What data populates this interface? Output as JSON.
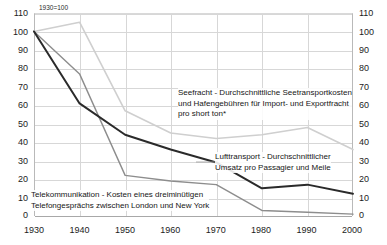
{
  "chart_data": {
    "type": "line",
    "title": "",
    "subtitle": "",
    "index_note": "1930=100",
    "xlabel": "",
    "ylabel": "",
    "x": [
      1930,
      1940,
      1950,
      1960,
      1970,
      1980,
      1990,
      2000
    ],
    "xtick_labels": [
      "1930",
      "1940",
      "1950",
      "1960",
      "1970",
      "1980",
      "1990",
      "2000"
    ],
    "xlim": [
      1930,
      2000
    ],
    "ylim": [
      0,
      110
    ],
    "ytick_labels": [
      "0",
      "10",
      "20",
      "30",
      "40",
      "50",
      "60",
      "70",
      "80",
      "90",
      "100",
      "110"
    ],
    "ytick_values": [
      0,
      10,
      20,
      30,
      40,
      50,
      60,
      70,
      80,
      90,
      100,
      110
    ],
    "grid": true,
    "legend": "annotations-inline",
    "dual_y_axis": true,
    "series": [
      {
        "name": "Seefracht",
        "color": "#cfcfcf",
        "width": 1.6,
        "values": [
          100,
          105,
          57,
          45,
          42,
          44,
          48,
          36
        ]
      },
      {
        "name": "Telekommunikation",
        "color": "#8d8d8d",
        "width": 1.4,
        "values": [
          100,
          77,
          22,
          19,
          17,
          3,
          2,
          1
        ]
      },
      {
        "name": "Lufttransport",
        "color": "#2a2a2a",
        "width": 2.0,
        "values": [
          100,
          61,
          44,
          36,
          29,
          15,
          17,
          12
        ]
      }
    ],
    "annotations": {
      "sea": {
        "lines": [
          "Seefracht - Durchschnittliche Seetransportkosten",
          "und Hafengebühren für Import- und Exportfracht",
          "pro short ton*"
        ]
      },
      "air": {
        "lines": [
          "Lufttransport - Durchschnittlicher",
          "Umsatz pro Passagier und Meile"
        ]
      },
      "telecom": {
        "lines": [
          "Telekommunikation - Kosten eines dreiminütigen",
          "Telefongesprächs zwischen London und New York"
        ]
      }
    },
    "colors": {
      "grid": "#d7d7d7",
      "axis": "#b9b9b9",
      "text": "#1c1c1c",
      "background": "#ffffff"
    }
  }
}
